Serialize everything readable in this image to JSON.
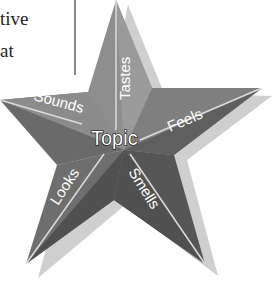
{
  "textbox": {
    "lines": [
      "tive",
      "at"
    ]
  },
  "star": {
    "center_label": "Topic",
    "points": [
      {
        "label": "Tastes"
      },
      {
        "label": "Feels"
      },
      {
        "label": "Smells"
      },
      {
        "label": "Looks"
      },
      {
        "label": "Sounds"
      }
    ]
  },
  "colors": {
    "facet_light": "#8c8c8c",
    "facet_dark": "#5e5e5e",
    "center": "#6a6a6a",
    "shadow": "#c8c8c8",
    "divider": "#d8d8d8"
  }
}
